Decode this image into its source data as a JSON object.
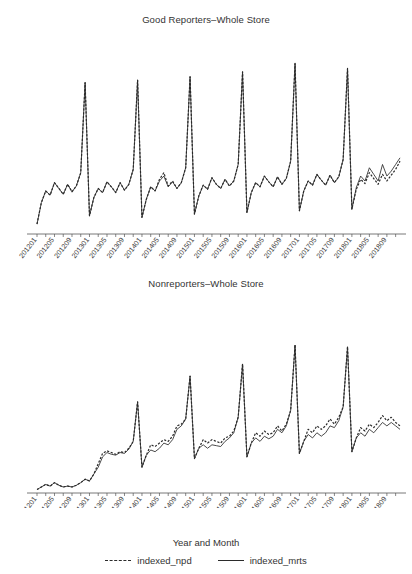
{
  "figure": {
    "axis_label_x": "Year and Month",
    "panels": [
      {
        "id": "good-reporters",
        "title": "Good Reporters–Whole Store"
      },
      {
        "id": "nonreporters",
        "title": "Nonreporters–Whole Store"
      }
    ],
    "legend": [
      {
        "name": "indexed_npd",
        "style": "dashed",
        "color": "#2b2b2b"
      },
      {
        "name": "indexed_mrts",
        "style": "solid",
        "color": "#2b2b2b"
      }
    ]
  },
  "chart_data": [
    {
      "type": "line",
      "title": "Good Reporters–Whole Store",
      "xlabel": "Year and Month",
      "ylabel": "",
      "grid": false,
      "legend_position": "bottom",
      "axis": {
        "y_visible": false,
        "x_visible": true,
        "ylim": [
          0,
          215
        ]
      },
      "x": [
        "201201",
        "201202",
        "201203",
        "201204",
        "201205",
        "201206",
        "201207",
        "201208",
        "201209",
        "201210",
        "201211",
        "201212",
        "201301",
        "201302",
        "201303",
        "201304",
        "201305",
        "201306",
        "201307",
        "201308",
        "201309",
        "201310",
        "201311",
        "201312",
        "201401",
        "201402",
        "201403",
        "201404",
        "201405",
        "201406",
        "201407",
        "201408",
        "201409",
        "201410",
        "201411",
        "201412",
        "201501",
        "201502",
        "201503",
        "201504",
        "201505",
        "201506",
        "201507",
        "201508",
        "201509",
        "201510",
        "201511",
        "201512",
        "201601",
        "201602",
        "201603",
        "201604",
        "201605",
        "201606",
        "201607",
        "201608",
        "201609",
        "201610",
        "201611",
        "201612",
        "201701",
        "201702",
        "201703",
        "201704",
        "201705",
        "201706",
        "201707",
        "201708",
        "201709",
        "201710",
        "201711",
        "201712",
        "201801",
        "201802",
        "201803",
        "201804",
        "201805",
        "201806",
        "201807",
        "201808",
        "201809",
        "201810",
        "201811",
        "201812"
      ],
      "tick_labels": [
        "201201",
        "201205",
        "201209",
        "201301",
        "201305",
        "201309",
        "201401",
        "201405",
        "201409",
        "201501",
        "201505",
        "201509",
        "201601",
        "201605",
        "201609",
        "201701",
        "201705",
        "201709",
        "201801",
        "201805",
        "201809"
      ],
      "tick_every_months": 4,
      "series": [
        {
          "name": "indexed_npd",
          "style": "dashed",
          "values": [
            12,
            38,
            52,
            47,
            62,
            55,
            48,
            60,
            51,
            58,
            74,
            183,
            22,
            44,
            55,
            50,
            63,
            57,
            50,
            62,
            53,
            60,
            78,
            186,
            20,
            42,
            57,
            52,
            66,
            74,
            58,
            64,
            55,
            62,
            80,
            190,
            24,
            46,
            59,
            54,
            68,
            60,
            55,
            66,
            58,
            64,
            84,
            196,
            26,
            50,
            62,
            57,
            70,
            63,
            57,
            69,
            60,
            67,
            88,
            206,
            28,
            52,
            64,
            59,
            72,
            65,
            59,
            71,
            62,
            69,
            90,
            200,
            30,
            54,
            66,
            61,
            74,
            67,
            60,
            72,
            64,
            71,
            78,
            88
          ]
        },
        {
          "name": "indexed_mrts",
          "style": "solid",
          "values": [
            12,
            38,
            52,
            47,
            62,
            55,
            48,
            60,
            51,
            58,
            74,
            183,
            22,
            44,
            55,
            50,
            63,
            57,
            50,
            62,
            53,
            60,
            78,
            186,
            20,
            42,
            57,
            52,
            64,
            70,
            57,
            63,
            55,
            62,
            80,
            190,
            24,
            46,
            59,
            54,
            68,
            60,
            55,
            66,
            58,
            64,
            84,
            196,
            26,
            50,
            62,
            57,
            70,
            63,
            57,
            69,
            60,
            67,
            88,
            206,
            28,
            52,
            64,
            59,
            72,
            65,
            59,
            71,
            62,
            69,
            90,
            200,
            30,
            56,
            70,
            64,
            80,
            72,
            64,
            84,
            70,
            76,
            84,
            92
          ]
        }
      ]
    },
    {
      "type": "line",
      "title": "Nonreporters–Whole Store",
      "xlabel": "Year and Month",
      "ylabel": "",
      "grid": false,
      "legend_position": "bottom",
      "axis": {
        "y_visible": false,
        "x_visible": true,
        "ylim": [
          0,
          215
        ]
      },
      "x": [
        "201201",
        "201202",
        "201203",
        "201204",
        "201205",
        "201206",
        "201207",
        "201208",
        "201209",
        "201210",
        "201211",
        "201212",
        "201301",
        "201302",
        "201303",
        "201304",
        "201305",
        "201306",
        "201307",
        "201308",
        "201309",
        "201310",
        "201311",
        "201312",
        "201401",
        "201402",
        "201403",
        "201404",
        "201405",
        "201406",
        "201407",
        "201408",
        "201409",
        "201410",
        "201411",
        "201412",
        "201501",
        "201502",
        "201503",
        "201504",
        "201505",
        "201506",
        "201507",
        "201508",
        "201509",
        "201510",
        "201511",
        "201512",
        "201601",
        "201602",
        "201603",
        "201604",
        "201605",
        "201606",
        "201607",
        "201608",
        "201609",
        "201610",
        "201611",
        "201612",
        "201701",
        "201702",
        "201703",
        "201704",
        "201705",
        "201706",
        "201707",
        "201708",
        "201709",
        "201710",
        "201711",
        "201712",
        "201801",
        "201802",
        "201803",
        "201804",
        "201805",
        "201806",
        "201807",
        "201808",
        "201809",
        "201810",
        "201811",
        "201812"
      ],
      "tick_labels": [
        "201201",
        "201205",
        "201209",
        "201301",
        "201305",
        "201309",
        "201401",
        "201405",
        "201409",
        "201501",
        "201505",
        "201509",
        "201601",
        "201605",
        "201609",
        "201701",
        "201705",
        "201709",
        "201801",
        "201805",
        "201809"
      ],
      "tick_every_months": 4,
      "series": [
        {
          "name": "indexed_npd",
          "style": "dashed",
          "values": [
            4,
            7,
            10,
            8,
            12,
            9,
            7,
            8,
            7,
            9,
            12,
            16,
            14,
            22,
            34,
            46,
            49,
            47,
            45,
            48,
            47,
            52,
            60,
            106,
            30,
            44,
            56,
            54,
            58,
            62,
            60,
            66,
            78,
            80,
            86,
            136,
            40,
            52,
            62,
            58,
            62,
            60,
            58,
            64,
            66,
            72,
            88,
            150,
            42,
            58,
            70,
            66,
            72,
            68,
            70,
            78,
            72,
            80,
            96,
            172,
            46,
            60,
            74,
            70,
            78,
            74,
            78,
            86,
            80,
            88,
            100,
            170,
            48,
            64,
            76,
            72,
            80,
            76,
            82,
            90,
            84,
            88,
            82,
            78
          ]
        },
        {
          "name": "indexed_mrts",
          "style": "solid",
          "values": [
            4,
            7,
            10,
            8,
            12,
            9,
            7,
            8,
            7,
            9,
            12,
            16,
            14,
            22,
            30,
            42,
            47,
            45,
            44,
            47,
            46,
            51,
            60,
            106,
            30,
            44,
            50,
            48,
            52,
            58,
            56,
            62,
            74,
            78,
            86,
            136,
            40,
            52,
            56,
            52,
            56,
            55,
            54,
            60,
            64,
            70,
            88,
            150,
            42,
            58,
            64,
            60,
            66,
            63,
            66,
            74,
            70,
            78,
            96,
            172,
            46,
            60,
            68,
            64,
            70,
            66,
            70,
            78,
            76,
            84,
            100,
            170,
            48,
            64,
            70,
            66,
            74,
            70,
            76,
            82,
            78,
            82,
            78,
            74
          ]
        }
      ]
    }
  ]
}
